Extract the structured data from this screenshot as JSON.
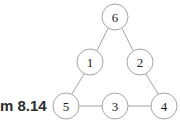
{
  "figure": {
    "background_color": "#ffffff",
    "stroke_color": "#9a9a9a",
    "label_color": "#1a1a1a",
    "node_radius": 13,
    "nodes": [
      {
        "id": "n6",
        "label": "6",
        "cx": 115,
        "cy": 17
      },
      {
        "id": "n1",
        "label": "1",
        "cx": 90,
        "cy": 62
      },
      {
        "id": "n2",
        "label": "2",
        "cx": 140,
        "cy": 62
      },
      {
        "id": "n5",
        "label": "5",
        "cx": 66,
        "cy": 106
      },
      {
        "id": "n3",
        "label": "3",
        "cx": 115,
        "cy": 106
      },
      {
        "id": "n4",
        "label": "4",
        "cx": 164,
        "cy": 106
      }
    ],
    "edges": [
      {
        "id": "e6-1",
        "from": "6",
        "to": "1",
        "x1": 108.0,
        "y1": 28.4,
        "x2": 97.0,
        "y2": 50.6
      },
      {
        "id": "e6-2",
        "from": "6",
        "to": "2",
        "x1": 122.0,
        "y1": 28.4,
        "x2": 133.0,
        "y2": 50.6
      },
      {
        "id": "e1-5",
        "from": "1",
        "to": "5",
        "x1": 84.3,
        "y1": 73.7,
        "x2": 71.7,
        "y2": 94.3
      },
      {
        "id": "e2-4",
        "from": "2",
        "to": "4",
        "x1": 145.7,
        "y1": 73.7,
        "x2": 158.3,
        "y2": 94.3
      },
      {
        "id": "e5-3",
        "from": "5",
        "to": "3",
        "x1": 79.0,
        "y1": 106,
        "x2": 102.0,
        "y2": 106
      },
      {
        "id": "e3-4",
        "from": "3",
        "to": "4",
        "x1": 128.0,
        "y1": 106,
        "x2": 151.0,
        "y2": 106
      }
    ]
  },
  "caption": {
    "text": "m 8.14"
  }
}
